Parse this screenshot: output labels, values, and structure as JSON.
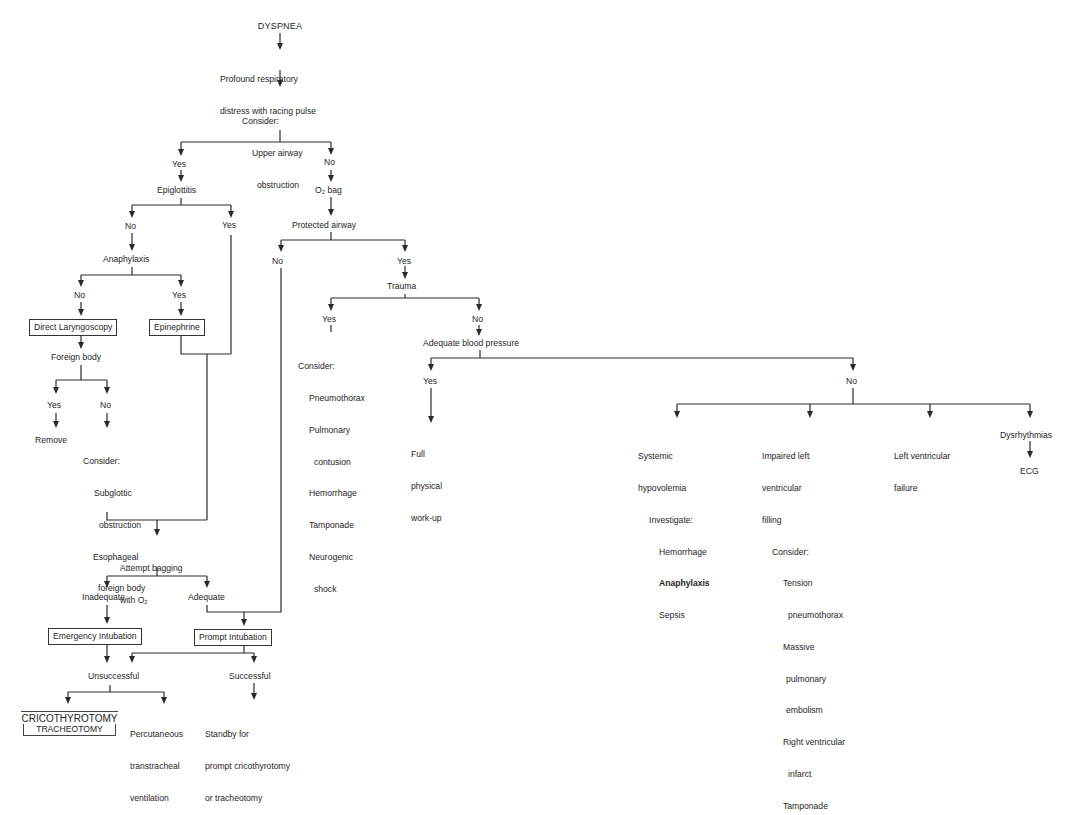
{
  "diagram": {
    "root": "DYSPNEA",
    "step1": [
      "Profound respiratory",
      "distress with racing pulse"
    ],
    "step2": {
      "label": "Consider:",
      "items": [
        "Upper airway",
        "obstruction"
      ]
    },
    "upper_yes": "Yes",
    "upper_no": "No",
    "epiglottitis": "Epiglottitis",
    "epi_no": "No",
    "epi_yes": "Yes",
    "anaphylaxis": "Anaphylaxis",
    "ana_no": "No",
    "ana_yes": "Yes",
    "direct_laryngoscopy": "Direct Laryngoscopy",
    "epinephrine": "Epinephrine",
    "foreign_body": "Foreign body",
    "fb_yes": "Yes",
    "fb_no": "No",
    "remove": "Remove",
    "fb_consider": {
      "label": "Consider:",
      "items": [
        "Subglottic",
        "obstruction",
        "Esophageal",
        "foreign body"
      ]
    },
    "attempt_bagging": [
      "Attempt bagging",
      "with O₂"
    ],
    "inadequate": "Inadequate",
    "adequate": "Adequate",
    "emergency_intubation": "Emergency Intubation",
    "prompt_intubation": "Prompt Intubation",
    "unsuccessful": "Unsuccessful",
    "successful": "Successful",
    "cricothyrotomy": "CRICOTHYROTOMY",
    "tracheotomy": "TRACHEOTOMY",
    "percutaneous": [
      "Percutaneous",
      "transtracheal",
      "ventilation"
    ],
    "standby": [
      "Standby for",
      "prompt cricothyrotomy",
      "or tracheotomy"
    ],
    "o2_bag": "O₂ bag",
    "protected_airway": "Protected airway",
    "pa_no": "No",
    "pa_yes": "Yes",
    "trauma": "Trauma",
    "trauma_yes": "Yes",
    "trauma_no": "No",
    "trauma_consider": {
      "label": "Consider:",
      "items": [
        "Pneumothorax",
        "Pulmonary",
        "contusion",
        "Hemorrhage",
        "Tamponade",
        "Neurogenic",
        "shock"
      ]
    },
    "adequate_bp": "Adequate blood pressure",
    "bp_yes": "Yes",
    "bp_no": "No",
    "full_workup": [
      "Full",
      "physical",
      "work-up"
    ],
    "systemic": {
      "lines": [
        "Systemic",
        "hypovolemia"
      ],
      "investigate": "Investigate:",
      "items": [
        "Hemorrhage",
        "Anaphylaxis",
        "Sepsis"
      ]
    },
    "impaired": {
      "lines": [
        "Impaired left",
        "ventricular",
        "filling"
      ],
      "consider": "Consider:",
      "items": [
        "Tension",
        "pneumothorax",
        "Massive",
        "pulmonary",
        "embolism",
        "Right ventricular",
        "infarct",
        "Tamponade"
      ]
    },
    "lv_failure": [
      "Left ventricular",
      "failure"
    ],
    "dysrhythmias": "Dysrhythmias",
    "ecg": "ECG"
  }
}
